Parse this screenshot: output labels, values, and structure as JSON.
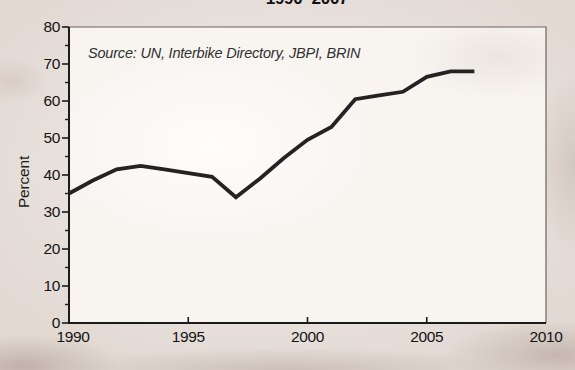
{
  "figure": {
    "title": "1990–2007",
    "source_note": "Source: UN, Interbike Directory, JBPI, BRIN",
    "y_axis_label": "Percent"
  },
  "colors": {
    "line": "#232323",
    "axis": "#1b1b1b",
    "box_border": "#6a645f",
    "text": "#141414",
    "paper": "#e2d9d3",
    "plot_background": "#f8f5f1"
  },
  "chart_data": {
    "type": "line",
    "title": "1990–2007",
    "xlabel": "",
    "ylabel": "Percent",
    "x": [
      1990,
      1991,
      1992,
      1993,
      1994,
      1995,
      1996,
      1997,
      1998,
      1999,
      2000,
      2001,
      2002,
      2003,
      2004,
      2005,
      2006,
      2007
    ],
    "values": [
      35,
      38.5,
      41.5,
      42.5,
      41.5,
      40.5,
      39.5,
      34,
      39,
      44.5,
      49.5,
      53,
      60.5,
      61.5,
      62.5,
      66.5,
      68,
      68
    ],
    "xlim": [
      1990,
      2010
    ],
    "ylim": [
      0,
      80
    ],
    "x_ticks": [
      1990,
      1995,
      2000,
      2005,
      2010
    ],
    "y_ticks": [
      0,
      10,
      20,
      30,
      40,
      50,
      60,
      70,
      80
    ],
    "y_minor_tick_interval": 5,
    "grid": false,
    "legend": null,
    "annotations": [
      "Source: UN, Interbike Directory, JBPI, BRIN"
    ]
  }
}
